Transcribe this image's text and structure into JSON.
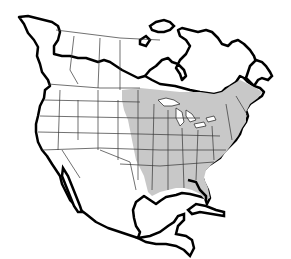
{
  "map": {
    "subject": "North America range map",
    "colors": {
      "background": "#ffffff",
      "land": "#ffffff",
      "range_fill": "#c8c8c8",
      "coastline": "#000000",
      "borders": "#333333"
    },
    "range": {
      "label": "Shaded range: eastern United States and southeastern Canada"
    }
  }
}
